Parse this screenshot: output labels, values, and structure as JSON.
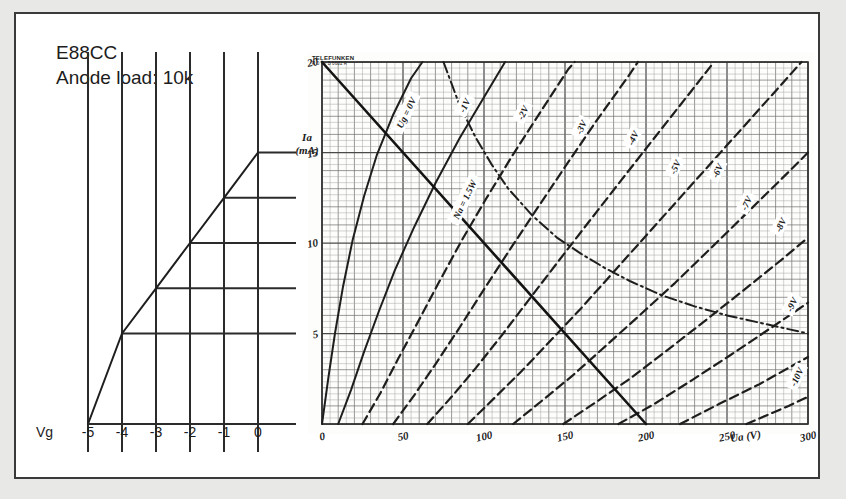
{
  "figure": {
    "tube_label": "E88CC",
    "load_label": "Anode load: 10k",
    "brand_line1": "TELEFUNKEN",
    "brand_line2": "R 0 V.- B 0602 R"
  },
  "left_panel": {
    "axis_name": "Vg",
    "tick_labels": [
      "-5",
      "-4",
      "-3",
      "-2",
      "-1",
      "0"
    ],
    "tick_values": [
      -5,
      -4,
      -3,
      -2,
      -1,
      0
    ],
    "transfer_points_ma": [
      0,
      5,
      7.5,
      10,
      12.5,
      15
    ]
  },
  "chart_data": {
    "type": "line",
    "xlabel": "Ua (V)",
    "ylabel": "Ia (mA)",
    "xlim": [
      0,
      300
    ],
    "ylim": [
      0,
      20
    ],
    "grid": true,
    "x_ticks": [
      0,
      50,
      100,
      150,
      200,
      250,
      300
    ],
    "x_tick_labels": [
      "0",
      "50",
      "100",
      "150",
      "200",
      "250",
      "300"
    ],
    "y_ticks": [
      0,
      5,
      10,
      15,
      20
    ],
    "y_tick_labels": [
      "0",
      "5",
      "10",
      "15",
      "20"
    ],
    "legend_position": "inline-curve-labels",
    "annotations": [
      {
        "text": "Ug = 0V",
        "x": 52,
        "y": 17.2
      },
      {
        "text": "-1V",
        "x": 88,
        "y": 17.6
      },
      {
        "text": "-2V",
        "x": 124,
        "y": 17.2
      },
      {
        "text": "-3V",
        "x": 160,
        "y": 16.4
      },
      {
        "text": "-4V",
        "x": 192,
        "y": 15.8
      },
      {
        "text": "-5V",
        "x": 218,
        "y": 14.2
      },
      {
        "text": "-6V",
        "x": 244,
        "y": 14.0
      },
      {
        "text": "-7V",
        "x": 262,
        "y": 12.2
      },
      {
        "text": "-8V",
        "x": 283,
        "y": 11.0
      },
      {
        "text": "-9V",
        "x": 290,
        "y": 6.6
      },
      {
        "text": "-10V",
        "x": 293,
        "y": 2.6
      },
      {
        "text": "Na = 1.5W",
        "x": 88,
        "y": 12.4
      }
    ],
    "series": [
      {
        "name": "Ug = 0V",
        "style": "solid",
        "points": [
          [
            0,
            0
          ],
          [
            4,
            2.6
          ],
          [
            8,
            5.0
          ],
          [
            13,
            7.6
          ],
          [
            19,
            10.2
          ],
          [
            26,
            12.6
          ],
          [
            34,
            14.9
          ],
          [
            44,
            17.1
          ],
          [
            55,
            19.1
          ],
          [
            62,
            20
          ]
        ]
      },
      {
        "name": "-1V",
        "style": "solid",
        "points": [
          [
            10,
            0
          ],
          [
            18,
            1.9
          ],
          [
            26,
            4.0
          ],
          [
            35,
            6.2
          ],
          [
            45,
            8.5
          ],
          [
            57,
            10.9
          ],
          [
            70,
            13.3
          ],
          [
            85,
            15.8
          ],
          [
            101,
            18.2
          ],
          [
            113,
            20
          ]
        ]
      },
      {
        "name": "-2V",
        "style": "dashed",
        "points": [
          [
            25,
            0
          ],
          [
            36,
            1.7
          ],
          [
            47,
            3.6
          ],
          [
            59,
            5.6
          ],
          [
            72,
            7.8
          ],
          [
            86,
            10.1
          ],
          [
            101,
            12.4
          ],
          [
            118,
            14.9
          ],
          [
            136,
            17.4
          ],
          [
            152,
            19.6
          ],
          [
            156,
            20
          ]
        ]
      },
      {
        "name": "-3V",
        "style": "dashed",
        "points": [
          [
            44,
            0
          ],
          [
            57,
            1.6
          ],
          [
            70,
            3.3
          ],
          [
            84,
            5.2
          ],
          [
            99,
            7.3
          ],
          [
            115,
            9.5
          ],
          [
            132,
            11.8
          ],
          [
            150,
            14.2
          ],
          [
            169,
            16.7
          ],
          [
            189,
            19.2
          ],
          [
            195,
            20
          ]
        ]
      },
      {
        "name": "-4V",
        "style": "dashed",
        "points": [
          [
            65,
            0
          ],
          [
            80,
            1.5
          ],
          [
            95,
            3.1
          ],
          [
            111,
            4.9
          ],
          [
            128,
            6.9
          ],
          [
            146,
            9.0
          ],
          [
            165,
            11.2
          ],
          [
            185,
            13.5
          ],
          [
            206,
            15.9
          ],
          [
            228,
            18.4
          ],
          [
            242,
            20
          ]
        ]
      },
      {
        "name": "-5V",
        "style": "dashed",
        "points": [
          [
            90,
            0
          ],
          [
            106,
            1.4
          ],
          [
            123,
            2.9
          ],
          [
            141,
            4.6
          ],
          [
            160,
            6.4
          ],
          [
            180,
            8.4
          ],
          [
            201,
            10.5
          ],
          [
            223,
            12.7
          ],
          [
            246,
            15.0
          ],
          [
            270,
            17.4
          ],
          [
            290,
            19.4
          ],
          [
            296,
            20
          ]
        ]
      },
      {
        "name": "-6V",
        "style": "dashed",
        "points": [
          [
            118,
            0
          ],
          [
            136,
            1.3
          ],
          [
            155,
            2.7
          ],
          [
            175,
            4.3
          ],
          [
            196,
            6.0
          ],
          [
            218,
            7.8
          ],
          [
            241,
            9.8
          ],
          [
            265,
            11.9
          ],
          [
            290,
            14.1
          ],
          [
            300,
            15.0
          ]
        ]
      },
      {
        "name": "-7V",
        "style": "dashed",
        "points": [
          [
            149,
            0
          ],
          [
            169,
            1.2
          ],
          [
            190,
            2.5
          ],
          [
            212,
            4.0
          ],
          [
            235,
            5.6
          ],
          [
            259,
            7.3
          ],
          [
            284,
            9.1
          ],
          [
            300,
            10.3
          ]
        ]
      },
      {
        "name": "-8V",
        "style": "dashed",
        "points": [
          [
            183,
            0
          ],
          [
            205,
            1.1
          ],
          [
            228,
            2.4
          ],
          [
            252,
            3.8
          ],
          [
            277,
            5.3
          ],
          [
            300,
            6.7
          ]
        ]
      },
      {
        "name": "-9V",
        "style": "dashed",
        "points": [
          [
            221,
            0
          ],
          [
            245,
            1.1
          ],
          [
            270,
            2.2
          ],
          [
            296,
            3.5
          ],
          [
            300,
            3.7
          ]
        ]
      },
      {
        "name": "-10V",
        "style": "dashed",
        "points": [
          [
            262,
            0
          ],
          [
            288,
            1.0
          ],
          [
            300,
            1.5
          ]
        ]
      },
      {
        "name": "Na = 1.5W",
        "style": "dash-dot",
        "points": [
          [
            75,
            20
          ],
          [
            85,
            17.6
          ],
          [
            95,
            15.8
          ],
          [
            105,
            14.3
          ],
          [
            115,
            13.0
          ],
          [
            130,
            11.5
          ],
          [
            145,
            10.3
          ],
          [
            160,
            9.4
          ],
          [
            175,
            8.6
          ],
          [
            190,
            7.9
          ],
          [
            210,
            7.1
          ],
          [
            230,
            6.5
          ],
          [
            250,
            6.0
          ],
          [
            270,
            5.6
          ],
          [
            290,
            5.2
          ],
          [
            300,
            5.0
          ]
        ]
      },
      {
        "name": "Load line 10k",
        "style": "solid-heavy",
        "points": [
          [
            0,
            20
          ],
          [
            200,
            0
          ]
        ]
      }
    ]
  }
}
